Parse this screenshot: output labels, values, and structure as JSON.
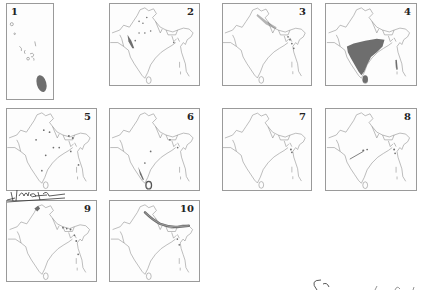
{
  "figure": {
    "panels": [
      {
        "id": "1",
        "label": "1",
        "type": "islands",
        "shading": "maldives-south"
      },
      {
        "id": "2",
        "label": "2",
        "type": "india",
        "shading": "western-coast-dots"
      },
      {
        "id": "3",
        "label": "3",
        "type": "india",
        "shading": "northeast-dots"
      },
      {
        "id": "4",
        "label": "4",
        "type": "india",
        "shading": "peninsular-fill"
      },
      {
        "id": "5",
        "label": "5",
        "type": "india",
        "shading": "scattered-dots"
      },
      {
        "id": "6",
        "label": "6",
        "type": "india",
        "shading": "southwest-srilanka"
      },
      {
        "id": "7",
        "label": "7",
        "type": "india",
        "shading": "northeast-few"
      },
      {
        "id": "8",
        "label": "8",
        "type": "india",
        "shading": "central-dots"
      },
      {
        "id": "9",
        "label": "9",
        "type": "india",
        "shading": "northwest-northeast"
      },
      {
        "id": "10",
        "label": "10",
        "type": "india",
        "shading": "himalayan-band"
      }
    ],
    "colors": {
      "outline": "#8c8c8c",
      "fill": "#6e6e6e",
      "border": "#9a9a9a",
      "ink": "#222222"
    },
    "annotations": {
      "handwriting_top_left": "signature-scribble",
      "handwriting_bottom_right": "signature-scribble"
    }
  }
}
